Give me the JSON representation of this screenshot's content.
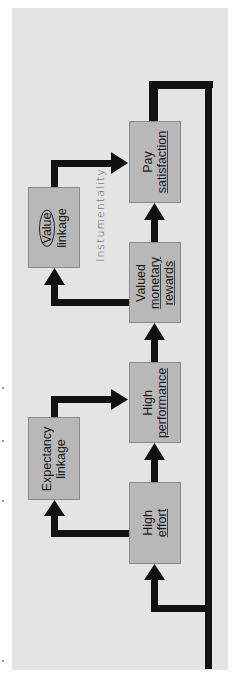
{
  "diagram": {
    "orientation": "rotated-90-ccw",
    "boxes": {
      "high_effort": {
        "line1": "High",
        "line2": "effort"
      },
      "high_performance": {
        "line1": "High",
        "line2": "performance"
      },
      "valued_monetary_rewards": {
        "line1": "Valued",
        "line2": "monetary",
        "line3": "rewards"
      },
      "pay_satisfaction": {
        "line1": "Pay",
        "line2": "satisfaction"
      },
      "expectancy_linkage": {
        "line1": "Expectancy",
        "line2": "linkage"
      },
      "value_linkage": {
        "line1": "Value",
        "line2": "linkage"
      }
    },
    "annotation": "Instumentality",
    "flow": [
      "High effort -> High performance",
      "High performance -> Valued monetary rewards",
      "Valued monetary rewards -> Pay satisfaction",
      "High effort -> Expectancy linkage -> High performance",
      "Valued monetary rewards -> Value linkage -> Pay satisfaction",
      "Pay satisfaction -> (feedback loop) -> High effort"
    ],
    "colors": {
      "panel": "#e4e4e4",
      "box": "#b8b8b8",
      "arrow": "#111111"
    }
  }
}
